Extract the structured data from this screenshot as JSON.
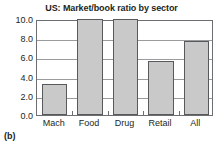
{
  "figure": {
    "caption": "(b)"
  },
  "chart_data": {
    "type": "bar",
    "title": "US: Market/book ratio by sector",
    "xlabel": "",
    "ylabel": "",
    "categories": [
      "Mach",
      "Food",
      "Drug",
      "Retail",
      "All"
    ],
    "values": [
      3.2,
      10.0,
      10.0,
      5.6,
      7.7
    ],
    "ylim": [
      0.0,
      10.0
    ],
    "ytick_labels": [
      "0.0",
      "2.0",
      "4.0",
      "6.0",
      "8.0",
      "10.0"
    ],
    "ytick_values": [
      0.0,
      2.0,
      4.0,
      6.0,
      8.0,
      10.0
    ],
    "grid": true,
    "grid_axis": "y",
    "legend": false,
    "bar_fill_color": "#c9c9c9",
    "bar_edge_color": "#58595b",
    "axis_color": "#6d6e71",
    "grid_color": "#9a9b9d",
    "text_color": "#231f20",
    "background_color": "#ffffff"
  }
}
